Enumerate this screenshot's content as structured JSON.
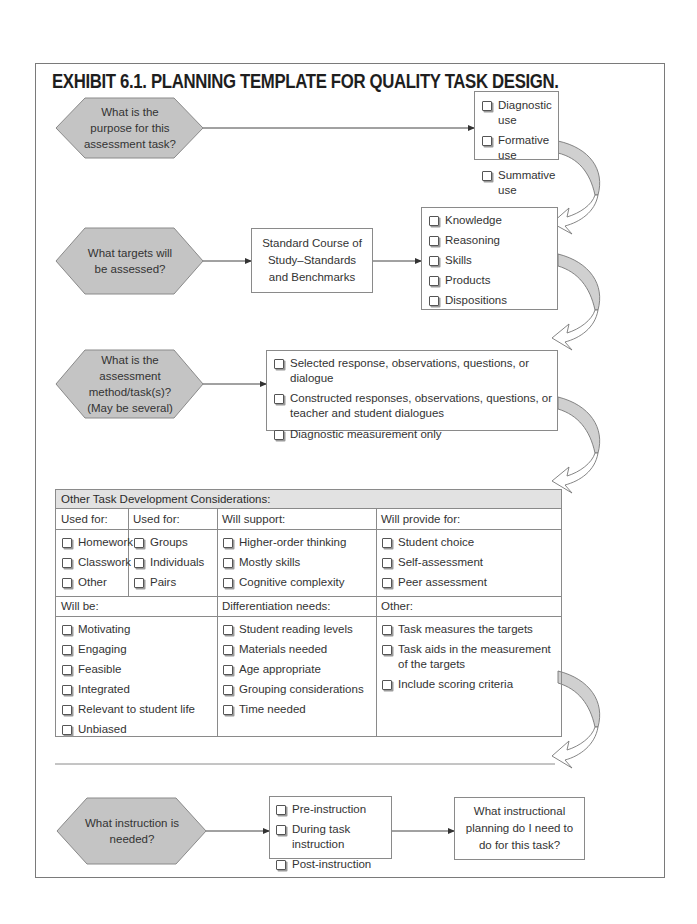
{
  "title": "EXHIBIT 6.1.  PLANNING TEMPLATE FOR QUALITY TASK DESIGN.",
  "colors": {
    "hexagon_fill": "#c4c4c4",
    "header_fill": "#e2e2e2",
    "arrow_fill": "#d0d0d0",
    "border": "#8a8a8a"
  },
  "step1": {
    "question": "What is the purpose for this assessment task?",
    "options": [
      "Diagnostic use",
      "Formative use",
      "Summative use"
    ]
  },
  "step2": {
    "question": "What targets will be assessed?",
    "middle_box": "Standard Course of Study–Standards and Benchmarks",
    "options": [
      "Knowledge",
      "Reasoning",
      "Skills",
      "Products",
      "Dispositions"
    ]
  },
  "step3": {
    "question": "What is the assessment method/task(s)? (May be several)",
    "options": [
      "Selected response, observations, questions, or dialogue",
      "Constructed responses, observations, questions, or teacher and student dialogues",
      "Diagnostic measurement only"
    ]
  },
  "considerations": {
    "header": "Other Task Development Considerations:",
    "row1": [
      {
        "label": "Used for:",
        "options": [
          "Homework",
          "Classwork",
          "Other"
        ]
      },
      {
        "label": "Used for:",
        "options": [
          "Groups",
          "Individuals",
          "Pairs"
        ]
      },
      {
        "label": "Will support:",
        "options": [
          "Higher-order thinking",
          "Mostly skills",
          "Cognitive complexity"
        ]
      },
      {
        "label": "Will provide for:",
        "options": [
          "Student choice",
          "Self-assessment",
          "Peer assessment"
        ]
      }
    ],
    "row2": [
      {
        "label": "Will be:",
        "options": [
          "Motivating",
          "Engaging",
          "Feasible",
          "Integrated",
          "Relevant to student life",
          "Unbiased"
        ]
      },
      {
        "label": "Differentiation needs:",
        "options": [
          "Student reading levels",
          "Materials needed",
          "Age appropriate",
          "Grouping considerations",
          "Time needed"
        ]
      },
      {
        "label": "Other:",
        "options": [
          "Task measures the targets",
          "Task aids in the measurement of the targets",
          "Include scoring criteria"
        ]
      }
    ]
  },
  "step4": {
    "question": "What instruction is needed?",
    "options": [
      "Pre-instruction",
      "During task instruction",
      "Post-instruction"
    ],
    "final_box": "What instructional planning do I need to do for this task?"
  }
}
